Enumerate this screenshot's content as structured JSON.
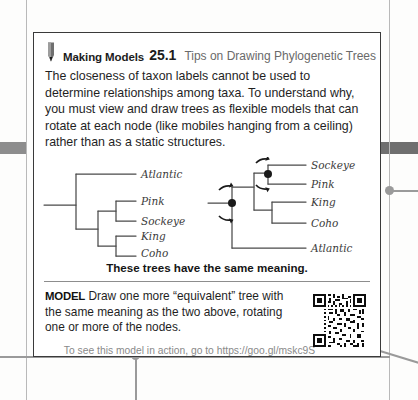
{
  "card": {
    "header": {
      "icon": "pencil-icon",
      "label": "Making Models",
      "number": "25.1",
      "subtitle": "Tips on Drawing Phylogenetic Trees"
    },
    "body_paragraph": "The closeness of taxon labels cannot be used to determine relationships among taxa. To understand why, you must view and draw trees as flexible models that can rotate at each node (like mobiles hanging from a ceiling) rather than as a static structures.",
    "figure": {
      "left_tree": {
        "name": "phylogenetic-tree-left",
        "taxa": [
          "Atlantic",
          "Pink",
          "Sockeye",
          "King",
          "Coho"
        ],
        "rotation_nodes": 0
      },
      "right_tree": {
        "name": "phylogenetic-tree-right",
        "taxa": [
          "Sockeye",
          "Pink",
          "King",
          "Coho",
          "Atlantic"
        ],
        "rotation_nodes": 2,
        "rotation_icon": "rotation-arrow-icon"
      },
      "caption": "These trees have the same meaning."
    },
    "model": {
      "keyword": "MODEL",
      "prompt": "Draw one more “equivalent” tree with the same meaning as the two above, rotating one or more of the nodes.",
      "qr_code_icon": "qr-code-icon"
    },
    "footer_note": "To see this model in action, go to https://goo.gl/mskc9S"
  },
  "colors": {
    "card_border": "#3a3a3a",
    "header_subtitle": "#6a6a6a",
    "edge_bar": "#8d8d8d",
    "connector": "#9a9a9a",
    "tree_stroke": "#4a4a4a",
    "node_dot": "#1a1a1a",
    "footer_text": "#8a8a8a"
  }
}
